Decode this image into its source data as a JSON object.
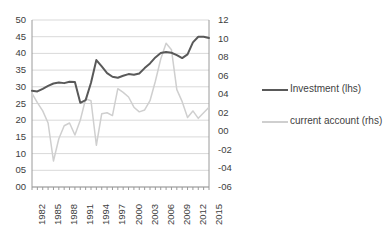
{
  "chart_data": {
    "type": "line",
    "title": "",
    "xlabel": "",
    "ylabel": "",
    "grid": true,
    "legend_position": "right",
    "x": [
      1982,
      1983,
      1984,
      1985,
      1986,
      1987,
      1988,
      1989,
      1990,
      1991,
      1992,
      1993,
      1994,
      1995,
      1996,
      1997,
      1998,
      1999,
      2000,
      2001,
      2002,
      2003,
      2004,
      2005,
      2006,
      2007,
      2008,
      2009,
      2010,
      2011,
      2012,
      2013,
      2014,
      2015
    ],
    "x_tick_labels": [
      "1982",
      "1985",
      "1988",
      "1991",
      "1994",
      "1997",
      "2000",
      "2003",
      "2006",
      "2009",
      "2012",
      "2015"
    ],
    "axes": {
      "left": {
        "label": "",
        "ylim": [
          0,
          50
        ],
        "ticks": [
          0,
          5,
          10,
          15,
          20,
          25,
          30,
          35,
          40,
          45,
          50
        ],
        "tick_labels": [
          "00",
          "05",
          "10",
          "15",
          "20",
          "25",
          "30",
          "35",
          "40",
          "45",
          "50"
        ]
      },
      "right": {
        "label": "",
        "ylim": [
          -6,
          12
        ],
        "ticks": [
          -6,
          -4,
          -2,
          0,
          2,
          4,
          6,
          8,
          10,
          12
        ],
        "tick_labels": [
          "-06",
          "-04",
          "-02",
          "00",
          "02",
          "04",
          "06",
          "08",
          "10",
          "12"
        ]
      }
    },
    "series": [
      {
        "name": "Investment (lhs)",
        "axis": "left",
        "color": "#595959",
        "values": [
          28.8,
          28.6,
          29.4,
          30.3,
          31.0,
          31.3,
          31.1,
          31.5,
          31.4,
          25.2,
          26.0,
          31.2,
          38.0,
          36.1,
          34.1,
          33.0,
          32.7,
          33.3,
          33.8,
          33.6,
          34.0,
          35.6,
          37.0,
          38.8,
          40.1,
          40.4,
          40.2,
          39.5,
          38.6,
          39.7,
          43.3,
          45.0,
          45.0,
          44.6
        ]
      },
      {
        "name": "current account (rhs)",
        "axis": "right",
        "color": "#cfcfcf",
        "values": [
          4.1,
          3.1,
          2.2,
          0.9,
          -3.2,
          -0.8,
          0.6,
          0.9,
          -0.4,
          1.2,
          3.5,
          3.3,
          -1.5,
          1.9,
          2.0,
          1.7,
          4.6,
          4.2,
          3.7,
          2.6,
          2.1,
          2.3,
          3.3,
          5.4,
          7.8,
          9.5,
          8.8,
          4.5,
          3.2,
          1.5,
          2.2,
          1.4,
          2.0,
          2.6
        ]
      }
    ]
  },
  "legend": {
    "items": [
      {
        "label": "Investment (lhs)",
        "color": "#595959"
      },
      {
        "label": "current account (rhs)",
        "color": "#cfcfcf"
      }
    ]
  }
}
